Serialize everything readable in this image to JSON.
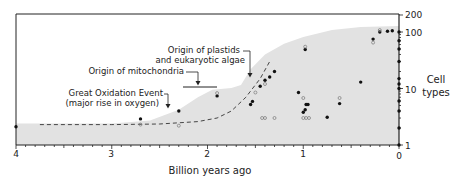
{
  "chart_data": {
    "type": "scatter",
    "title": "",
    "xlabel": "Billion years ago",
    "ylabel": "Cell types",
    "x_axis": {
      "range": [
        4,
        0
      ],
      "reversed": true,
      "ticks": [
        4,
        3,
        2,
        1,
        0
      ],
      "tick_labels": [
        "4",
        "3",
        "2",
        "1",
        "0"
      ],
      "minor_tick_step": 0.1
    },
    "y_axis": {
      "scale": "log",
      "range": [
        1,
        200
      ],
      "ticks": [
        1,
        10,
        100,
        200
      ],
      "tick_labels": [
        "1",
        "10",
        "100",
        "200"
      ],
      "position": "right"
    },
    "grid": false,
    "legend": null,
    "envelope": {
      "description": "Shaded region: maximum number of cell types through time",
      "color": "#e2e2e2",
      "points": [
        [
          4.0,
          2.4
        ],
        [
          3.0,
          2.4
        ],
        [
          2.6,
          2.7
        ],
        [
          2.3,
          4.2
        ],
        [
          2.1,
          7.0
        ],
        [
          1.95,
          9.5
        ],
        [
          1.75,
          10.2
        ],
        [
          1.65,
          11.5
        ],
        [
          1.55,
          22
        ],
        [
          1.4,
          40
        ],
        [
          1.2,
          62
        ],
        [
          1.0,
          82
        ],
        [
          0.7,
          108
        ],
        [
          0.4,
          122
        ],
        [
          0.0,
          128
        ]
      ]
    },
    "trend_line": {
      "style": "dashed",
      "points": [
        [
          3.75,
          2.3
        ],
        [
          3.0,
          2.3
        ],
        [
          2.5,
          2.35
        ],
        [
          2.1,
          2.6
        ],
        [
          1.9,
          3.0
        ],
        [
          1.75,
          4.0
        ],
        [
          1.6,
          7.0
        ],
        [
          1.45,
          15
        ],
        [
          1.35,
          30
        ]
      ]
    },
    "series": [
      {
        "name": "filled points (max cell types, fossil)",
        "marker": "filled-circle",
        "points": [
          [
            4.0,
            2.1
          ],
          [
            2.7,
            2.9
          ],
          [
            2.3,
            4.0
          ],
          [
            1.9,
            7.4
          ],
          [
            1.55,
            5.2
          ],
          [
            1.53,
            5.9
          ],
          [
            1.45,
            11
          ],
          [
            1.4,
            14
          ],
          [
            1.35,
            16
          ],
          [
            1.3,
            20
          ],
          [
            1.05,
            8.5
          ],
          [
            1.0,
            3.8
          ],
          [
            0.98,
            4.2
          ],
          [
            0.97,
            5.2
          ],
          [
            0.95,
            5.2
          ],
          [
            0.98,
            49
          ],
          [
            0.75,
            3.1
          ],
          [
            0.62,
            5.4
          ],
          [
            0.4,
            13
          ],
          [
            0.27,
            75
          ],
          [
            0.2,
            100
          ],
          [
            0.12,
            103
          ],
          [
            0.07,
            105
          ],
          [
            0.0,
            100
          ],
          [
            0.0,
            70
          ],
          [
            0.0,
            50
          ],
          [
            0.0,
            30
          ],
          [
            0.0,
            15
          ],
          [
            0.0,
            12
          ],
          [
            0.0,
            10
          ],
          [
            0.0,
            6
          ],
          [
            0.0,
            4
          ],
          [
            0.0,
            2
          ],
          [
            0.0,
            1
          ]
        ]
      },
      {
        "name": "open points (min estimate)",
        "marker": "open-circle",
        "points": [
          [
            2.7,
            2.3
          ],
          [
            2.3,
            2.2
          ],
          [
            1.9,
            8.3
          ],
          [
            1.4,
            12
          ],
          [
            1.5,
            8.5
          ],
          [
            1.43,
            3.0
          ],
          [
            1.4,
            3.0
          ],
          [
            1.3,
            3.0
          ],
          [
            1.0,
            3.0
          ],
          [
            0.97,
            3.0
          ],
          [
            0.94,
            3.0
          ],
          [
            1.0,
            6.8
          ],
          [
            0.98,
            55
          ],
          [
            0.62,
            6.8
          ],
          [
            0.27,
            65
          ],
          [
            0.2,
            108
          ]
        ]
      }
    ],
    "annotations": [
      {
        "text_lines": [
          "Great Oxidation Event",
          "(major rise in oxygen)"
        ],
        "x": 2.3,
        "arrow": "down"
      },
      {
        "text_lines": [
          "Origin of mitochondria"
        ],
        "x": 2.0,
        "arrow": "down",
        "bracket": [
          2.2,
          1.8
        ]
      },
      {
        "text_lines": [
          "Origin of plastids",
          "and eukaryotic algae"
        ],
        "x": 1.6,
        "arrow": "down"
      }
    ]
  },
  "labels": {
    "xlabel": "Billion years ago",
    "ylabel_line1": "Cell",
    "ylabel_line2": "types",
    "x_ticks": [
      "4",
      "3",
      "2",
      "1",
      "0"
    ],
    "y_ticks": [
      "200",
      "100",
      "10",
      "1"
    ],
    "ann_goe_1": "Great Oxidation Event",
    "ann_goe_2": "(major rise in oxygen)",
    "ann_mito": "Origin of mitochondria",
    "ann_plastid_1": "Origin of plastids",
    "ann_plastid_2": "and eukaryotic algae"
  }
}
